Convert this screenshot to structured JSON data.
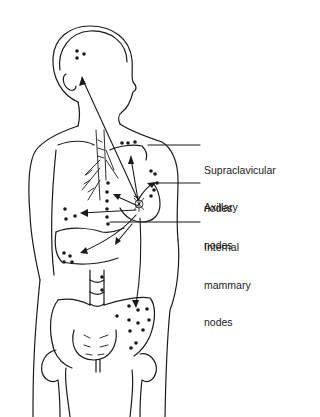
{
  "figure": {
    "line_color": "#1a1a1a",
    "background": "#ffffff"
  },
  "labels": {
    "supraclavicular": {
      "line1": "Supraclavicular",
      "line2": "nodes"
    },
    "axillary": {
      "line1": "Axillary",
      "line2": "nodes"
    },
    "internal_mammary": {
      "line1": "Internal",
      "line2": "mammary",
      "line3": "nodes"
    }
  },
  "metastatic_sites": [
    "brain",
    "supraclavicular nodes",
    "axillary nodes",
    "internal mammary nodes",
    "lung",
    "pleura",
    "liver",
    "spine",
    "pelvis"
  ]
}
